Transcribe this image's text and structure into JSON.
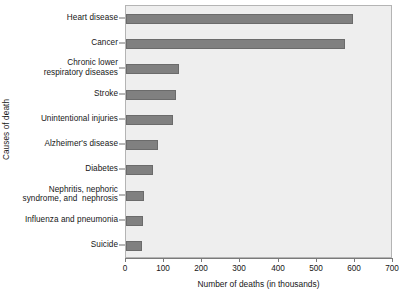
{
  "chart_data": {
    "type": "bar",
    "orientation": "horizontal",
    "title": "",
    "xlabel": "Number of deaths (in thousands)",
    "ylabel": "Causes of death",
    "xlim": [
      0,
      700
    ],
    "xticks": [
      0,
      100,
      200,
      300,
      400,
      500,
      600,
      700
    ],
    "xtick_labels": [
      "0",
      "100",
      "200",
      "300",
      "400",
      "500",
      "600",
      "700"
    ],
    "grid": false,
    "legend": null,
    "bar_color": "#808080",
    "plot_background": "#eeeeee",
    "categories": [
      "Heart disease",
      "Cancer",
      "Chronic lower\nrespiratory diseases",
      "Stroke",
      "Unintentional injuries",
      "Alzheimer's disease",
      "Diabetes",
      "Nephritis, nephoric\nsyndrome, and  nephrosis",
      "Influenza and pneumonia",
      "Suicide"
    ],
    "values": [
      595,
      574,
      139,
      132,
      124,
      84,
      71,
      48,
      45,
      41
    ]
  }
}
